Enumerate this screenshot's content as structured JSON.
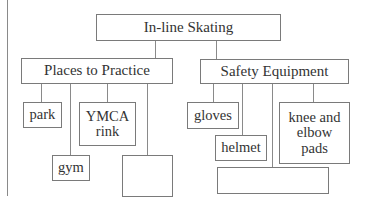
{
  "diagram": {
    "type": "tree / concept map",
    "root": {
      "label": "In-line Skating"
    },
    "branches": [
      {
        "label": "Places to Practice",
        "children": [
          {
            "label": "park"
          },
          {
            "label": "gym"
          },
          {
            "label": "YMCA rink"
          },
          {
            "label": ""
          }
        ]
      },
      {
        "label": "Safety Equipment",
        "children": [
          {
            "label": "gloves"
          },
          {
            "label": "helmet"
          },
          {
            "label": ""
          },
          {
            "label": "knee and elbow pads"
          }
        ]
      }
    ]
  },
  "labels": {
    "root": "In-line Skating",
    "places": "Places to Practice",
    "safety": "Safety Equipment",
    "park": "park",
    "gym": "gym",
    "ymca_line1": "YMCA",
    "ymca_line2": "rink",
    "places_blank": "",
    "gloves": "gloves",
    "helmet": "helmet",
    "safety_blank": "",
    "knee_line1": "knee and",
    "knee_line2": "elbow",
    "knee_line3": "pads"
  },
  "colors": {
    "line": "#8a8a8a",
    "border": "#7a7a7a",
    "text": "#333333",
    "background": "#ffffff"
  }
}
